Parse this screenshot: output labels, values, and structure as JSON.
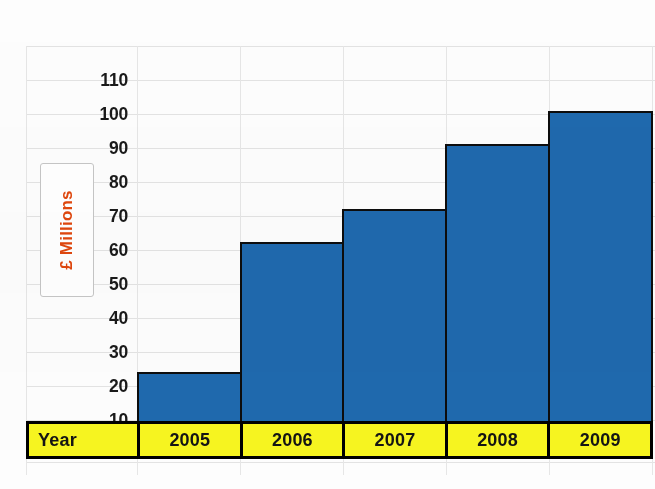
{
  "chart_data": {
    "type": "bar",
    "title": "",
    "subtitle": "",
    "xlabel": "Year",
    "ylabel": "£ Millions",
    "categories": [
      "2005",
      "2006",
      "2007",
      "2008",
      "2009"
    ],
    "values": [
      15,
      55,
      65,
      85,
      95
    ],
    "series": [
      {
        "name": "£ Millions",
        "values": [
          15,
          55,
          65,
          85,
          95
        ]
      }
    ],
    "ylim": [
      0,
      115
    ],
    "yticks": [
      10,
      20,
      30,
      40,
      50,
      60,
      70,
      80,
      90,
      100,
      110
    ],
    "ytick_labels": [
      "10",
      "20",
      "30",
      "40",
      "50",
      "60",
      "70",
      "80",
      "90",
      "100",
      "110"
    ],
    "grid": true,
    "legend": false,
    "legend_position": "none",
    "bar_color": "#1f69ae",
    "bar_border_color": "#0d0d0d",
    "axis_label_color": "#e0470e",
    "year_row_color": "#f7f520",
    "tick_label_color": "#1a1a1a",
    "annotations": []
  },
  "axis": {
    "y_title": "£ Millions",
    "ticks": [
      "110",
      "100",
      "90",
      "80",
      "70",
      "60",
      "50",
      "40",
      "30",
      "20",
      "10"
    ]
  },
  "year_table": {
    "header": "Year",
    "cells": [
      "2005",
      "2006",
      "2007",
      "2008",
      "2009"
    ]
  }
}
